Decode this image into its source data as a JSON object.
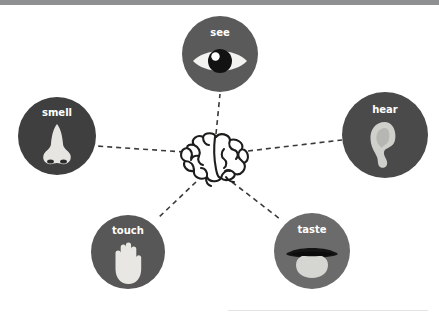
{
  "diagram": {
    "background_color": "#ffffff",
    "top_bar_color": "#8f9092",
    "link_style": "dashed",
    "link_color": "#3a3a3a",
    "center": {
      "name": "brain",
      "icon": "brain-icon",
      "outline_color": "#1d1d1b",
      "fill_color": "#ffffff",
      "cx": 214,
      "cy": 157
    },
    "nodes": [
      {
        "id": "see",
        "label": "see",
        "icon": "eye-icon",
        "circle_color": "#5a5a5a",
        "icon_color": "#f0f0ee",
        "cx": 220,
        "cy": 54,
        "r": 38,
        "label_font_size": 10
      },
      {
        "id": "smell",
        "label": "smell",
        "icon": "nose-icon",
        "circle_color": "#3f3f3f",
        "icon_color": "#e3e3e0",
        "cx": 57,
        "cy": 136,
        "r": 39,
        "label_font_size": 10
      },
      {
        "id": "hear",
        "label": "hear",
        "icon": "ear-icon",
        "circle_color": "#4a4a4a",
        "icon_color": "#c9c9c6",
        "cx": 385,
        "cy": 135,
        "r": 43,
        "label_font_size": 10
      },
      {
        "id": "touch",
        "label": "touch",
        "icon": "hand-icon",
        "circle_color": "#575757",
        "icon_color": "#e5e4e0",
        "cx": 128,
        "cy": 252,
        "r": 37,
        "label_font_size": 10
      },
      {
        "id": "taste",
        "label": "taste",
        "icon": "mouth-tongue-icon",
        "circle_color": "#6b6b6b",
        "icon_color": "#d2d2cf",
        "cx": 312,
        "cy": 251,
        "r": 38,
        "label_font_size": 10
      }
    ],
    "links": [
      {
        "from": "brain",
        "to": "see",
        "x1": 216,
        "y1": 134,
        "x2": 220,
        "y2": 94
      },
      {
        "from": "brain",
        "to": "smell",
        "x1": 184,
        "y1": 152,
        "x2": 96,
        "y2": 146
      },
      {
        "from": "brain",
        "to": "hear",
        "x1": 248,
        "y1": 151,
        "x2": 342,
        "y2": 140
      },
      {
        "from": "brain",
        "to": "touch",
        "x1": 196,
        "y1": 182,
        "x2": 157,
        "y2": 219
      },
      {
        "from": "brain",
        "to": "taste",
        "x1": 232,
        "y1": 182,
        "x2": 280,
        "y2": 219
      }
    ]
  }
}
